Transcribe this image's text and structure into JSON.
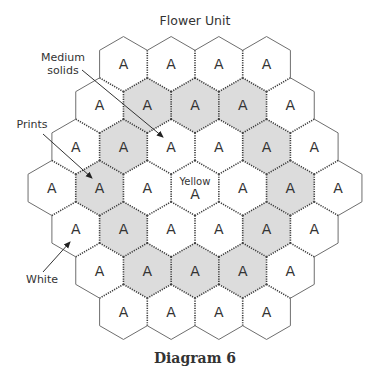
{
  "title": "Flower Unit",
  "caption": "Diagram 6",
  "colors": {
    "shaded": "#dcdcdc",
    "white": "#ffffff",
    "outer_stroke": "#6e6e6e",
    "seam_stroke": "#3a3a3a",
    "text": "#333333"
  },
  "grid": {
    "center_x": 195,
    "center_y": 188,
    "hex_width": 47.7,
    "rows": [
      {
        "cells": [
          {
            "letter": "A",
            "fill": "white"
          },
          {
            "letter": "A",
            "fill": "white"
          },
          {
            "letter": "A",
            "fill": "white"
          },
          {
            "letter": "A",
            "fill": "white"
          }
        ]
      },
      {
        "cells": [
          {
            "letter": "A",
            "fill": "white"
          },
          {
            "letter": "A",
            "fill": "shaded"
          },
          {
            "letter": "A",
            "fill": "shaded"
          },
          {
            "letter": "A",
            "fill": "shaded"
          },
          {
            "letter": "A",
            "fill": "white"
          }
        ]
      },
      {
        "cells": [
          {
            "letter": "A",
            "fill": "white"
          },
          {
            "letter": "A",
            "fill": "shaded"
          },
          {
            "letter": "A",
            "fill": "white"
          },
          {
            "letter": "A",
            "fill": "white"
          },
          {
            "letter": "A",
            "fill": "shaded"
          },
          {
            "letter": "A",
            "fill": "white"
          }
        ]
      },
      {
        "cells": [
          {
            "letter": "A",
            "fill": "white"
          },
          {
            "letter": "A",
            "fill": "shaded"
          },
          {
            "letter": "A",
            "fill": "white"
          },
          {
            "letter": "A",
            "fill": "white",
            "sublabel": "Yellow"
          },
          {
            "letter": "A",
            "fill": "white"
          },
          {
            "letter": "A",
            "fill": "shaded"
          },
          {
            "letter": "A",
            "fill": "white"
          }
        ]
      },
      {
        "cells": [
          {
            "letter": "A",
            "fill": "white"
          },
          {
            "letter": "A",
            "fill": "shaded"
          },
          {
            "letter": "A",
            "fill": "white"
          },
          {
            "letter": "A",
            "fill": "white"
          },
          {
            "letter": "A",
            "fill": "shaded"
          },
          {
            "letter": "A",
            "fill": "white"
          }
        ]
      },
      {
        "cells": [
          {
            "letter": "A",
            "fill": "white"
          },
          {
            "letter": "A",
            "fill": "shaded"
          },
          {
            "letter": "A",
            "fill": "shaded"
          },
          {
            "letter": "A",
            "fill": "shaded"
          },
          {
            "letter": "A",
            "fill": "white"
          }
        ]
      },
      {
        "cells": [
          {
            "letter": "A",
            "fill": "white"
          },
          {
            "letter": "A",
            "fill": "white"
          },
          {
            "letter": "A",
            "fill": "white"
          },
          {
            "letter": "A",
            "fill": "white"
          }
        ]
      }
    ]
  },
  "callouts": [
    {
      "id": "medium-solids",
      "lines": [
        "Medium",
        "solids"
      ],
      "label_x": 38,
      "label_y": 51,
      "label_w": 50,
      "arrow": {
        "x1": 82,
        "y1": 70,
        "x2": 163,
        "y2": 137
      }
    },
    {
      "id": "prints",
      "lines": [
        "Prints"
      ],
      "label_x": 14,
      "label_y": 118,
      "label_w": 36,
      "arrow": {
        "x1": 43,
        "y1": 134,
        "x2": 92,
        "y2": 178
      }
    },
    {
      "id": "white",
      "lines": [
        "White"
      ],
      "label_x": 24,
      "label_y": 273,
      "label_w": 36,
      "arrow": {
        "x1": 43,
        "y1": 272,
        "x2": 70,
        "y2": 242
      }
    }
  ]
}
